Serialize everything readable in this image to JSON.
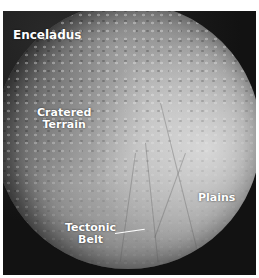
{
  "image": {
    "subject": "moon-surface-photo",
    "title": "Enceladus",
    "labels": [
      {
        "id": "cratered-terrain",
        "lines": [
          "Cratered",
          "Terrain"
        ]
      },
      {
        "id": "plains",
        "lines": [
          "Plains"
        ]
      },
      {
        "id": "tectonic-belt",
        "lines": [
          "Tectonic",
          "Belt"
        ]
      }
    ],
    "colors": {
      "background": "#141414",
      "surface_light": "#e6e6e6",
      "surface_dark": "#3c3c3c",
      "label_text": "#ffffff"
    }
  }
}
